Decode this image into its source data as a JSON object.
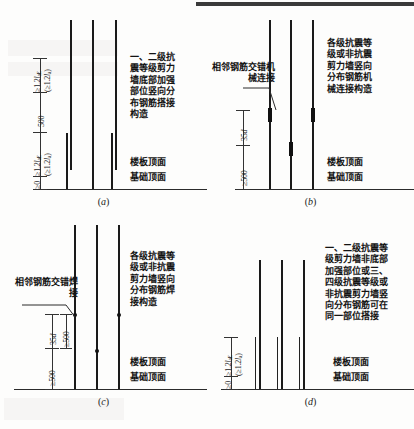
{
  "figure": {
    "panels": [
      {
        "id": "a",
        "caption_open": "(",
        "caption_letter": "a",
        "caption_close": ")",
        "description": "一、二级抗震等级剪力墙底部加强部位竖向分布钢筋搭接构造",
        "dimensions": [
          {
            "name": "upper-lap-length",
            "prefix": "≥",
            "value": "1.2",
            "symbol": "l",
            "subscript": "aE"
          },
          {
            "name": "upper-lap-length-paren",
            "prefix": "(≥",
            "value": "1.2",
            "symbol": "l",
            "subscript": "a",
            "suffix": ")"
          },
          {
            "name": "stagger-spacing",
            "value": "500"
          },
          {
            "name": "lower-lap-length",
            "prefix": "≥",
            "value": "1.2",
            "symbol": "l",
            "subscript": "aE"
          },
          {
            "name": "lower-lap-length-paren",
            "prefix": "(≥",
            "value": "1.2",
            "symbol": "l",
            "subscript": "a",
            "suffix": ")"
          },
          {
            "name": "base-offset",
            "prefix": "≥",
            "value": "0"
          }
        ],
        "surface_labels": [
          "楼板顶面",
          "基础顶面"
        ]
      },
      {
        "id": "b",
        "caption_open": "(",
        "caption_letter": "b",
        "caption_close": ")",
        "description": "各级抗震等级或非抗震剪力墙竖向分布钢筋机械连接构造",
        "callout": "相邻钢筋交错机械连接",
        "dimensions": [
          {
            "name": "stagger-distance",
            "value": "35",
            "symbol": "d"
          },
          {
            "name": "first-connection-height",
            "prefix": "≥",
            "value": "500"
          }
        ],
        "surface_labels": [
          "楼板顶面",
          "基础顶面"
        ]
      },
      {
        "id": "c",
        "caption_open": "(",
        "caption_letter": "c",
        "caption_close": ")",
        "description": "各级抗震等级或非抗震剪力墙竖向分布钢筋焊接构造",
        "callout": "相邻钢筋交错焊接",
        "dimensions": [
          {
            "name": "stagger-distance",
            "value": "35",
            "symbol": "d"
          },
          {
            "name": "stagger-distance-min",
            "prefix": "≥",
            "value": "500"
          },
          {
            "name": "first-weld-height",
            "prefix": "≥",
            "value": "500"
          }
        ],
        "surface_labels": [
          "楼板顶面",
          "基础顶面"
        ]
      },
      {
        "id": "d",
        "caption_open": "(",
        "caption_letter": "d",
        "caption_close": ")",
        "description": "一、二级抗震等级剪力墙非底部加强部位或三、四级抗震等级或非抗震剪力墙竖向分布钢筋可在同一部位搭接",
        "dimensions": [
          {
            "name": "lap-length",
            "prefix": "≥",
            "value": "1.2",
            "symbol": "l",
            "subscript": "aE"
          },
          {
            "name": "lap-length-paren",
            "prefix": "(≥",
            "value": "1.2",
            "symbol": "l",
            "subscript": "a",
            "suffix": ")"
          },
          {
            "name": "base-offset",
            "prefix": "≥",
            "value": "0"
          }
        ],
        "surface_labels": [
          "楼板顶面",
          "基础顶面"
        ]
      }
    ],
    "colors": {
      "ink": "#1a1a1a",
      "paper": "#fdfdfc",
      "dimension_line": "#333333"
    }
  }
}
